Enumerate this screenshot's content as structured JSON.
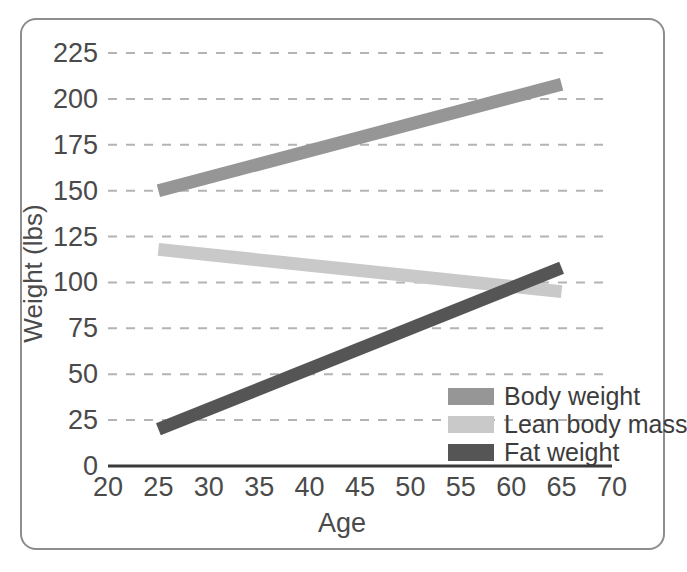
{
  "chart_data": {
    "type": "line",
    "title": "",
    "subtitle": "",
    "xlabel": "Age",
    "ylabel": "Weight (lbs)",
    "xlim": [
      20,
      70
    ],
    "ylim": [
      0,
      225
    ],
    "xticks": [
      20,
      25,
      30,
      35,
      40,
      45,
      50,
      55,
      60,
      65,
      70
    ],
    "yticks": [
      0,
      25,
      50,
      75,
      100,
      125,
      150,
      175,
      200,
      225
    ],
    "xtick_labels": [
      "20",
      "25",
      "30",
      "35",
      "40",
      "45",
      "50",
      "55",
      "60",
      "65",
      "70"
    ],
    "ytick_labels": [
      "0",
      "25",
      "50",
      "75",
      "100",
      "125",
      "150",
      "175",
      "200",
      "225"
    ],
    "grid": "horizontal-dashed",
    "legend_position": "inside-lower-right",
    "x": [
      25,
      65
    ],
    "series": [
      {
        "name": "Body weight",
        "values": [
          150,
          208
        ],
        "color": "#969696"
      },
      {
        "name": "Lean body mass",
        "values": [
          118,
          95
        ],
        "color": "#c9c9c9"
      },
      {
        "name": "Fat weight",
        "values": [
          20,
          108
        ],
        "color": "#555555"
      }
    ]
  },
  "axes": {
    "ylabel": "Weight (lbs)",
    "xlabel": "Age",
    "ytick_labels": [
      "225",
      "200",
      "175",
      "150",
      "125",
      "100",
      "75",
      "50",
      "25",
      "0"
    ],
    "xtick_labels": [
      "20",
      "25",
      "30",
      "35",
      "40",
      "45",
      "50",
      "55",
      "60",
      "65",
      "70"
    ]
  },
  "legend": {
    "items": [
      {
        "label": "Body weight",
        "color": "#969696"
      },
      {
        "label": "Lean body mass",
        "color": "#c9c9c9"
      },
      {
        "label": "Fat weight",
        "color": "#555555"
      }
    ]
  },
  "colors": {
    "frame": "#8d8d8d",
    "grid": "#b4b4b4",
    "axis": "#3a3a3a",
    "text": "#4a4a4a",
    "background": "#ffffff"
  }
}
